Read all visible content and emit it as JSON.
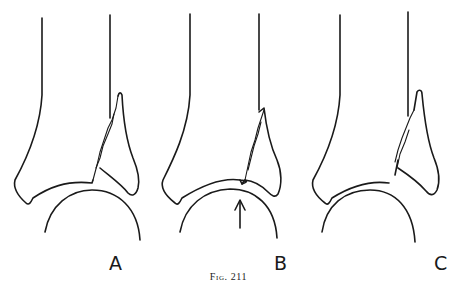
{
  "figure": {
    "caption": "Fig. 211",
    "panels": [
      {
        "label": "A",
        "description": "Distal tibia with oblique fracture line separating medial malleolus fragment; talus below"
      },
      {
        "label": "B",
        "description": "Fracture with articular step; arrow indicating upward force from talus"
      },
      {
        "label": "C",
        "description": "Fracture with fragment displaced, gap at joint surface"
      }
    ],
    "colors": {
      "line": "#1a1a1a",
      "background": "#ffffff"
    }
  }
}
